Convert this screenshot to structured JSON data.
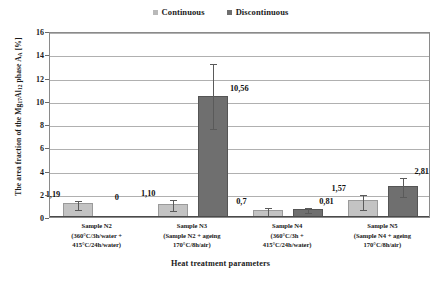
{
  "chart_data": {
    "type": "bar",
    "title": "",
    "xlabel": "Heat treatment parameters",
    "ylabel": "The area fraction of  the  Mg17Al12 phase AA [%]",
    "ylabel_parts": {
      "pre": "The area fraction of  the  Mg",
      "sub1": "17",
      "mid1": "Al",
      "sub2": "12",
      "mid2": " phase A",
      "sub3": "A",
      "post": " [%]"
    },
    "categories": [
      "Sample N2 (360°C/3h/water + 415°C/24h/water)",
      "Sample N3 (Sample N2 + ageing 170°C/8h/air)",
      "Sample N4 (360°C/3h + 415°C/24h/water)",
      "Sample N5 (Sample N4 + ageing 170°C/8h/air)"
    ],
    "category_lines": [
      [
        "Sample N2",
        "(360°C/3h/water +",
        "415°C/24h/water)"
      ],
      [
        "Sample N3",
        "(Sample N2 + ageing",
        "170°C/8h/air)"
      ],
      [
        "Sample N4",
        "(360°C/3h +",
        "415°C/24h/water)"
      ],
      [
        "Sample N5",
        "(Sample N4 + ageing",
        "170°C/8h/air)"
      ]
    ],
    "series": [
      {
        "name": "Continuous",
        "color": "#c3c3c3",
        "values": [
          1.19,
          1.1,
          0.58,
          1.48
        ],
        "labels": [
          "1,19",
          "1,10",
          "0,7",
          "1,57"
        ],
        "errors_low": [
          0.42,
          0.42,
          0.3,
          0.72
        ],
        "errors_high": [
          0.4,
          0.55,
          0.37,
          0.6
        ]
      },
      {
        "name": "Discontinuous",
        "color": "#6f6f6f",
        "values": [
          0,
          10.45,
          0.72,
          2.7
        ],
        "labels": [
          "0",
          "10,56",
          "0,81",
          "2,81"
        ],
        "errors_low": [
          0,
          2.75,
          0.2,
          0.82
        ],
        "errors_high": [
          0,
          2.9,
          0.22,
          0.85
        ]
      }
    ],
    "ylim": [
      0,
      16
    ],
    "yticks": [
      0,
      2,
      4,
      6,
      8,
      10,
      12,
      14,
      16
    ],
    "ytick_labels": [
      "0",
      "2",
      "4",
      "6",
      "8",
      "10",
      "12",
      "14",
      "16"
    ],
    "grid": true,
    "legend_position": "top-center"
  },
  "legend": {
    "items": [
      {
        "label": "Continuous",
        "swatch": "continuous-swatch"
      },
      {
        "label": "Discontinuous",
        "swatch": "discontinuous-swatch"
      }
    ]
  }
}
